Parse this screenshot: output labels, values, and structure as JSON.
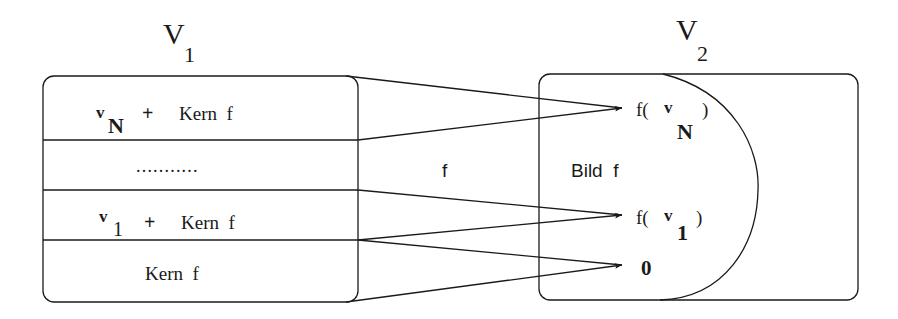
{
  "diagram": {
    "type": "linear-map-kernel-image",
    "left_space": {
      "name": "V",
      "subscript": "1",
      "rows": [
        {
          "vector": "v",
          "vector_sub": "N",
          "plus": "+",
          "label": "Kern  f"
        },
        {
          "ellipsis": "..........."
        },
        {
          "vector": "v",
          "vector_sub": "1",
          "plus": "+",
          "label": "Kern  f"
        },
        {
          "label": "Kern  f"
        }
      ]
    },
    "map_label": "f",
    "right_space": {
      "name": "V",
      "subscript": "2",
      "image_label": "Bild  f",
      "targets": [
        {
          "prefix": "f(",
          "vector": "v",
          "vector_sub": "N",
          "suffix": ")"
        },
        {
          "prefix": "f(",
          "vector": "v",
          "vector_sub": "1",
          "suffix": ")"
        },
        {
          "zero": "0"
        }
      ]
    },
    "arrows": [
      {
        "from": "row-vN-coset",
        "to": "f(vN)"
      },
      {
        "from": "row-v1-coset",
        "to": "f(v1)"
      },
      {
        "from": "row-kernel",
        "to": "0"
      }
    ]
  }
}
